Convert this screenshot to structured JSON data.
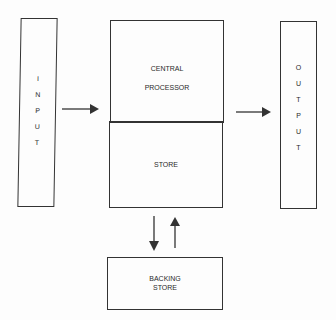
{
  "diagram": {
    "input": {
      "letters": [
        "I",
        "N",
        "P",
        "U",
        "T"
      ]
    },
    "output": {
      "letters": [
        "O",
        "U",
        "T",
        "P",
        "U",
        "T"
      ]
    },
    "central_processor": {
      "line1": "CENTRAL",
      "line2": "PROCESSOR"
    },
    "store": {
      "label": "STORE"
    },
    "backing_store": {
      "line1": "BACKING",
      "line2": "STORE"
    },
    "arrows": [
      {
        "from": "input",
        "to": "central_processor"
      },
      {
        "from": "central_processor",
        "to": "output"
      },
      {
        "from": "store",
        "to": "backing_store"
      },
      {
        "from": "backing_store",
        "to": "store"
      }
    ]
  }
}
